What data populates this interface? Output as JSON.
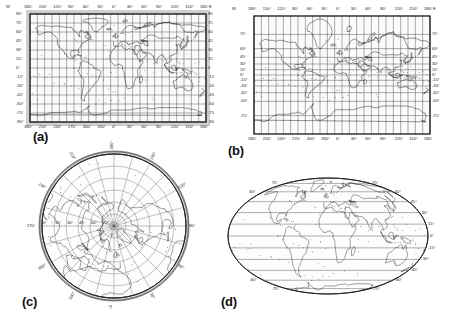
{
  "figure": {
    "kind": "map-projection-figure",
    "panel_count": 4,
    "background": "#ffffff",
    "line_color": "#101010"
  },
  "panels": [
    {
      "id": "a",
      "label": "(a)",
      "projection": "cylindrical-equidistant",
      "top_axis": {
        "prefix": "W",
        "suffix": "E",
        "ticks": [
          "180°",
          "150°",
          "120°",
          "90°",
          "60°",
          "30°",
          "0°",
          "30°",
          "60°",
          "90°",
          "120°",
          "150°",
          "180°"
        ]
      },
      "bottom_axis": {
        "ticks": [
          "180°",
          "210°",
          "240°",
          "270°",
          "300°",
          "330°",
          "0°",
          "30°",
          "60°",
          "90°",
          "120°",
          "150°",
          "180°"
        ]
      },
      "left_axis": {
        "ticks": [
          "90°",
          "75°",
          "60°",
          "45°",
          "30°",
          "15°",
          "0°",
          "-15°",
          "-30°",
          "-45°",
          "-60°",
          "-75°",
          "-90°"
        ]
      },
      "right_axis": {
        "ticks": [
          "90",
          "75",
          "60",
          "45",
          "30",
          "15",
          "0",
          "-15",
          "-30",
          "-45",
          "-60",
          "-75",
          "-90"
        ]
      }
    },
    {
      "id": "b",
      "label": "(b)",
      "projection": "mercator",
      "top_axis": {
        "prefix": "W",
        "suffix": "E",
        "ticks": [
          "180°",
          "150°",
          "120°",
          "90°",
          "60°",
          "30°",
          "0°",
          "30°",
          "60°",
          "90°",
          "120°",
          "150°",
          "180°"
        ]
      },
      "bottom_axis": {
        "ticks": [
          "180°",
          "210°",
          "240°",
          "270°",
          "300°",
          "330°",
          "0°",
          "30°",
          "60°",
          "90°",
          "120°",
          "150°",
          "180°"
        ]
      },
      "left_axis": {
        "ticks": [
          "75°",
          "60°",
          "45°",
          "30°",
          "15°",
          "0°",
          "-15°",
          "-30°",
          "-45°",
          "-60°",
          "-75°"
        ]
      },
      "right_axis": {
        "ticks": [
          "75°",
          "60°",
          "45°",
          "30°",
          "15°",
          "0°",
          "-15°",
          "-30°",
          "-45°",
          "-60°",
          "-75°"
        ]
      }
    },
    {
      "id": "c",
      "label": "(c)",
      "projection": "polar-azimuthal-north",
      "rim_axis": {
        "ticks": [
          "180°",
          "150°",
          "120°",
          "90°",
          "60°",
          "30°",
          "0°",
          "330°",
          "300°",
          "270°",
          "240°",
          "210°"
        ]
      },
      "latitude_rings": [
        "75°",
        "60°",
        "45°",
        "30°",
        "15°",
        "0°"
      ]
    },
    {
      "id": "d",
      "label": "(d)",
      "projection": "mollweide",
      "left_axis": {
        "ticks": [
          "75°",
          "60°",
          "45°",
          "30°",
          "15°",
          "0°",
          "-15°",
          "-30°",
          "-45°",
          "-60°",
          "-75°"
        ]
      },
      "right_axis": {
        "ticks": [
          "75°",
          "60°",
          "45°",
          "30°",
          "15°",
          "0°",
          "-15°",
          "-30°",
          "-45°",
          "-60°",
          "-75°"
        ]
      }
    }
  ]
}
